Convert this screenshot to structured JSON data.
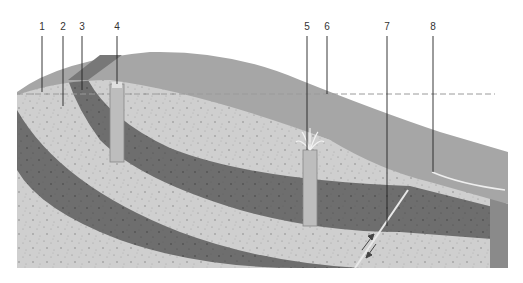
{
  "diagram": {
    "type": "geological-cross-section",
    "labels": [
      {
        "id": "1",
        "text": "1",
        "x": 42,
        "y_top": 20,
        "y_end": 92
      },
      {
        "id": "2",
        "text": "2",
        "x": 63,
        "y_top": 20,
        "y_end": 106
      },
      {
        "id": "3",
        "text": "3",
        "x": 82,
        "y_top": 20,
        "y_end": 90
      },
      {
        "id": "4",
        "text": "4",
        "x": 117,
        "y_top": 20,
        "y_end": 84
      },
      {
        "id": "5",
        "text": "5",
        "x": 307,
        "y_top": 20,
        "y_end": 150
      },
      {
        "id": "6",
        "text": "6",
        "x": 327,
        "y_top": 20,
        "y_end": 94
      },
      {
        "id": "7",
        "text": "7",
        "x": 387,
        "y_top": 20,
        "y_end": 226
      },
      {
        "id": "8",
        "text": "8",
        "x": 433,
        "y_top": 20,
        "y_end": 172
      }
    ],
    "elements": {
      "water_table_line": "dashed horizontal line at y≈94 (label 6)",
      "surface_layer": "unsaturated upper zone (label 1)",
      "permeable_layer": "speckled porous rock (label 2)",
      "aquifer_band": "dark confined layer (label 3)",
      "ordinary_well": "well tapping the water table (label 4)",
      "artesian_well": "flowing well with spray (label 5)",
      "fault": "fault with displacement arrows (label 7)",
      "spring_lake": "spring / water outlet at surface (label 8)"
    },
    "colors": {
      "surface": "#a6a6a6",
      "surface_top": "#b8b8b8",
      "light_rock": "#cfcfcf",
      "dark_band": "#6e6e6e",
      "well": "#bdbdbd",
      "line": "#222222",
      "dash": "#9a9a9a",
      "block_side": "#8a8a8a"
    }
  }
}
